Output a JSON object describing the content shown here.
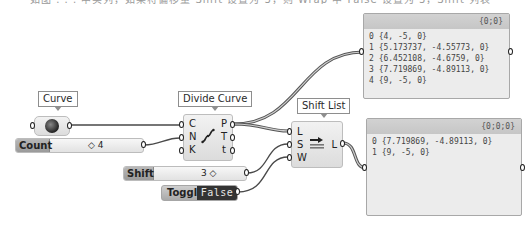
{
  "caption_fragment": "如图 . . . 中实列，如果将偏移量 Shift 设置为 3，则 Wrap 中 False 设置为 3，Shift 列表",
  "components": {
    "curve": {
      "tag": "Curve",
      "icon": "curve-param-icon"
    },
    "count_slider": {
      "label": "Count",
      "value": "◇ 4"
    },
    "divide_curve": {
      "tag": "Divide Curve",
      "inputs": [
        "C",
        "N",
        "K"
      ],
      "outputs": [
        "P",
        "T",
        "t"
      ],
      "icon": "divide-curve-icon"
    },
    "shift_list": {
      "tag": "Shift List",
      "inputs": [
        "L",
        "S",
        "W"
      ],
      "outputs": [
        "L"
      ],
      "icon": "shift-list-icon"
    },
    "shift_slider": {
      "label": "Shift",
      "value": "3 ◇"
    },
    "toggle": {
      "label": "Toggle",
      "state": "False"
    }
  },
  "panels": {
    "points_panel": {
      "path": "{0;0}",
      "rows": [
        "0 {4, -5, 0}",
        "1 {5.173737, -4.55773, 0}",
        "2 {6.452108, -4.6759, 0}",
        "3 {7.719869, -4.89113, 0}",
        "4 {9, -5, 0}"
      ]
    },
    "shifted_panel": {
      "path": "{0;0;0}",
      "rows": [
        "0 {7.719869, -4.89113, 0}",
        "1 {9, -5, 0}"
      ]
    }
  },
  "colors": {
    "wire": "#4a4a4a",
    "canvas": "#ffffff",
    "panel_bg": "#ececec",
    "panel_header": "#cbcbcb",
    "toggle_state_bg": "#333333"
  }
}
